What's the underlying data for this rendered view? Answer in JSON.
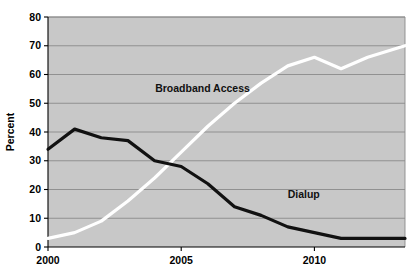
{
  "chart_data": {
    "type": "line",
    "title": "",
    "subtitle": "",
    "xlabel": "",
    "ylabel": "Percent",
    "xlim": [
      2000,
      2013.4
    ],
    "ylim": [
      0,
      80
    ],
    "grid": "horizontal",
    "legend_position": "inline-annotations",
    "background_color": "#c8c8c8",
    "xticks": [
      2000,
      2005,
      2010
    ],
    "xtick_labels": [
      "2000",
      "2005",
      "2010"
    ],
    "yticks": [
      0,
      10,
      20,
      30,
      40,
      50,
      60,
      70,
      80
    ],
    "ytick_labels": [
      "0",
      "10",
      "20",
      "30",
      "40",
      "50",
      "60",
      "70",
      "80"
    ],
    "x": [
      2000,
      2001,
      2002,
      2003,
      2004,
      2005,
      2006,
      2007,
      2008,
      2009,
      2010,
      2011,
      2012,
      2013.4
    ],
    "series": [
      {
        "name": "Broadband Access",
        "color": "#ffffff",
        "label_text": "Broadband Access",
        "values": [
          3,
          5,
          9,
          16,
          24,
          33,
          42,
          50,
          57,
          63,
          66,
          62,
          66,
          70
        ]
      },
      {
        "name": "Dialup",
        "color": "#111111",
        "label_text": "Dialup",
        "values": [
          34,
          41,
          38,
          37,
          30,
          28,
          22,
          14,
          11,
          7,
          5,
          3,
          3,
          3
        ]
      }
    ],
    "annotations": [
      {
        "name": "broadband-label",
        "text": "Broadband Access",
        "x": 2005.8,
        "y": 54
      },
      {
        "name": "dialup-label",
        "text": "Dialup",
        "x": 2009.6,
        "y": 17
      }
    ]
  }
}
